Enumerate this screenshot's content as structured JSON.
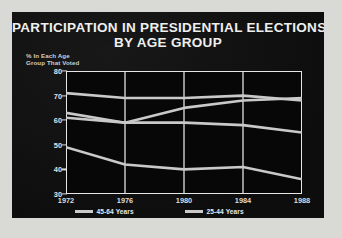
{
  "poster": {
    "frame_color": "#d9d9d5",
    "panel_color": "#0d0d0d"
  },
  "title": {
    "line1": "PARTICIPATION IN PRESIDENTIAL ELECTIONS",
    "line2": "BY AGE GROUP"
  },
  "yaxis_caption": {
    "line1": "% In Each Age",
    "line2": "Group That Voted"
  },
  "source": "Source: Bureau of the Census",
  "legend": [
    {
      "label": "45-64 Years",
      "color": "#c9c9c9"
    },
    {
      "label": "25-44 Years",
      "color": "#c9c9c9"
    },
    {
      "label": "65 Years and Over",
      "color": "#c9c9c9"
    },
    {
      "label": "18-24 Years",
      "color": "#c9c9c9"
    }
  ],
  "chart_data": {
    "type": "line",
    "title": "PARTICIPATION IN PRESIDENTIAL ELECTIONS BY AGE GROUP",
    "xlabel": "",
    "ylabel": "% In Each Age Group That Voted",
    "x": [
      "1972",
      "1976",
      "1980",
      "1984",
      "1988"
    ],
    "xtick_labels": [
      "1972",
      "1976",
      "1980",
      "1984",
      "1988"
    ],
    "ytick_labels": [
      "80",
      "70",
      "60",
      "50",
      "40",
      "30"
    ],
    "ylim": [
      30,
      80
    ],
    "ytick_step": 10,
    "grid": "vertical",
    "legend_position": "bottom",
    "line_color": "#c9c9c9",
    "series": [
      {
        "name": "45-64 Years",
        "values": [
          71,
          69,
          69,
          70,
          68
        ]
      },
      {
        "name": "65 Years and Over",
        "values": [
          63,
          59,
          65,
          68,
          69
        ]
      },
      {
        "name": "25-44 Years",
        "values": [
          61,
          59,
          59,
          58,
          55
        ]
      },
      {
        "name": "18-24 Years",
        "values": [
          49,
          42,
          40,
          41,
          36
        ]
      }
    ]
  }
}
